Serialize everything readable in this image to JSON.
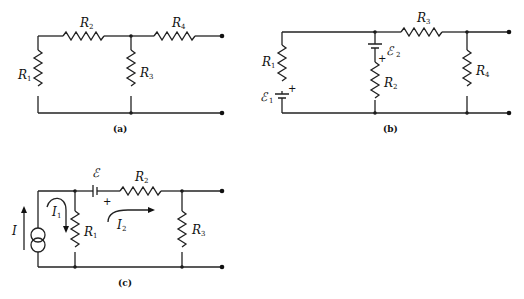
{
  "figures": [
    {
      "caption": "(a)",
      "components": {
        "R1": {
          "symbol": "R",
          "sub": "1"
        },
        "R2": {
          "symbol": "R",
          "sub": "2"
        },
        "R3": {
          "symbol": "R",
          "sub": "3"
        },
        "R4": {
          "symbol": "R",
          "sub": "4"
        }
      }
    },
    {
      "caption": "(b)",
      "components": {
        "R1": {
          "symbol": "R",
          "sub": "1"
        },
        "R2": {
          "symbol": "R",
          "sub": "2"
        },
        "R3": {
          "symbol": "R",
          "sub": "3"
        },
        "R4": {
          "symbol": "R",
          "sub": "4"
        },
        "E1": {
          "symbol": "ℰ",
          "sub": "1"
        },
        "E2": {
          "symbol": "ℰ",
          "sub": "2"
        },
        "plus": "+"
      }
    },
    {
      "caption": "(c)",
      "components": {
        "R1": {
          "symbol": "R",
          "sub": "1"
        },
        "R2": {
          "symbol": "R",
          "sub": "2"
        },
        "R3": {
          "symbol": "R",
          "sub": "3"
        },
        "E": {
          "symbol": "ℰ"
        },
        "I": {
          "symbol": "I"
        },
        "I1": {
          "symbol": "I",
          "sub": "1"
        },
        "I2": {
          "symbol": "I",
          "sub": "2"
        },
        "plus": "+"
      }
    }
  ]
}
